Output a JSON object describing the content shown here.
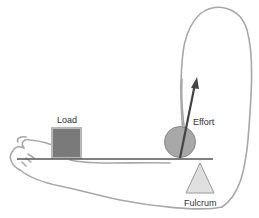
{
  "diagram": {
    "labels": {
      "load": "Load",
      "effort": "Effort",
      "fulcrum": "Fulcrum"
    },
    "elements": {
      "arm_outline": "arm-outline",
      "lever_bar": "lever-bar",
      "load_box": "load-box",
      "effort_arrow": "effort-arrow",
      "joint_circle": "joint-circle",
      "fulcrum_triangle": "fulcrum-triangle"
    },
    "colors": {
      "outline": "#a0a0a0",
      "lever": "#555555",
      "load_fill": "#7a7a7a",
      "load_border": "#b8b8b8",
      "joint_fill": "#a8a8a8",
      "arrow": "#444444",
      "fulcrum_fill": "#e0e0e0",
      "fulcrum_stroke": "#999999",
      "text": "#333333"
    }
  }
}
